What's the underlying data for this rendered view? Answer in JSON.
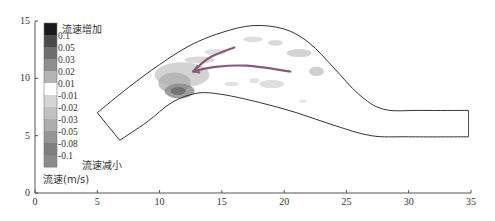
{
  "chart_data": {
    "type": "heatmap",
    "title": "",
    "xlabel": "",
    "ylabel": "",
    "xlim": [
      0,
      35
    ],
    "ylim": [
      0,
      15
    ],
    "x_ticks": [
      "0",
      "5",
      "10",
      "15",
      "20",
      "25",
      "30",
      "35"
    ],
    "y_ticks": [
      "0",
      "5",
      "10",
      "15"
    ],
    "grid": false,
    "colorbar": {
      "title": "流速(m/s)",
      "top_annotation": "流速增加",
      "bottom_annotation": "流速减小",
      "levels": [
        "0.1",
        "0.05",
        "0.03",
        "0.02",
        "0.01",
        "-0.01",
        "-0.02",
        "-0.03",
        "-0.05",
        "-0.08",
        "-0.1"
      ],
      "colors": [
        "#1a1a1a",
        "#4a4a4a",
        "#6e6e6e",
        "#8e8e8e",
        "#b4b4b4",
        "#ffffff",
        "#d6d6d6",
        "#c2c2c2",
        "#adadad",
        "#969696",
        "#7e7e7e",
        "#8a8a8a"
      ]
    },
    "channel_outline": {
      "outer_bank": [
        [
          5,
          7
        ],
        [
          7.5,
          9.2
        ],
        [
          10,
          11.2
        ],
        [
          12.5,
          12.9
        ],
        [
          15,
          14.0
        ],
        [
          17.5,
          14.6
        ],
        [
          20,
          14.3
        ],
        [
          22,
          13.1
        ],
        [
          24,
          10.9
        ],
        [
          26,
          8.6
        ],
        [
          28,
          7.3
        ],
        [
          31,
          7.2
        ],
        [
          34.8,
          7.2
        ]
      ],
      "inner_bank": [
        [
          6.8,
          4.6
        ],
        [
          9,
          6.2
        ],
        [
          11,
          7.9
        ],
        [
          13,
          8.7
        ],
        [
          15,
          8.6
        ],
        [
          18,
          7.9
        ],
        [
          21,
          7.0
        ],
        [
          24,
          5.9
        ],
        [
          27,
          5.0
        ],
        [
          30,
          4.9
        ],
        [
          34.8,
          4.9
        ]
      ],
      "outlet_edge": [
        [
          34.8,
          7.2
        ],
        [
          34.8,
          4.9
        ]
      ]
    },
    "arrows": [
      {
        "name": "arrow-upper",
        "points": [
          [
            16,
            12.7
          ],
          [
            14,
            11.8
          ],
          [
            12.7,
            10.6
          ]
        ],
        "color": "#8a5a7a"
      },
      {
        "name": "arrow-lower",
        "points": [
          [
            20.5,
            10.6
          ],
          [
            17,
            11.1
          ],
          [
            14.5,
            11.0
          ],
          [
            12.7,
            10.6
          ]
        ],
        "color": "#8a5a7a"
      }
    ],
    "regions": [
      {
        "name": "increase-core",
        "center": [
          11.6,
          8.9
        ],
        "level": "0.03"
      },
      {
        "name": "increase-spread",
        "center": [
          12,
          10.3
        ],
        "level": "0.01"
      }
    ]
  }
}
